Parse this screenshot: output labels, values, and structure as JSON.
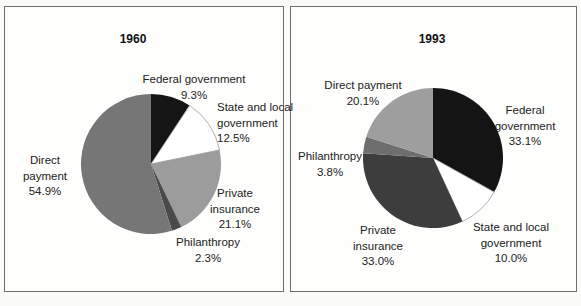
{
  "chart_data": [
    {
      "type": "pie",
      "title": "1960",
      "categories": [
        "Federal government",
        "State and local government",
        "Private insurance",
        "Philanthropy",
        "Direct payment"
      ],
      "values": [
        9.3,
        12.5,
        21.1,
        2.3,
        54.9
      ],
      "unit": "percent",
      "colors": [
        "#151515",
        "#ffffff",
        "#9c9c9c",
        "#4a4a4a",
        "#767676"
      ],
      "labels": [
        "Federal government\n9.3%",
        "State and local\ngovernment\n12.5%",
        "Private\ninsurance\n21.1%",
        "Philanthropy\n2.3%",
        "Direct\npayment\n54.9%"
      ],
      "start_angle_deg": 0,
      "direction": "clockwise",
      "legend": "none"
    },
    {
      "type": "pie",
      "title": "1993",
      "categories": [
        "Federal government",
        "State and local government",
        "Private insurance",
        "Philanthropy",
        "Direct payment"
      ],
      "values": [
        33.1,
        10.0,
        33.0,
        3.8,
        20.1
      ],
      "unit": "percent",
      "colors": [
        "#141414",
        "#ffffff",
        "#3d3d3d",
        "#6e6e6e",
        "#9e9e9e"
      ],
      "labels": [
        "Federal\ngovernment\n33.1%",
        "State and local\ngovernment\n10.0%",
        "Private\ninsurance\n33.0%",
        "Philanthropy\n3.8%",
        "Direct payment\n20.1%"
      ],
      "start_angle_deg": 0,
      "direction": "clockwise",
      "legend": "none"
    }
  ]
}
